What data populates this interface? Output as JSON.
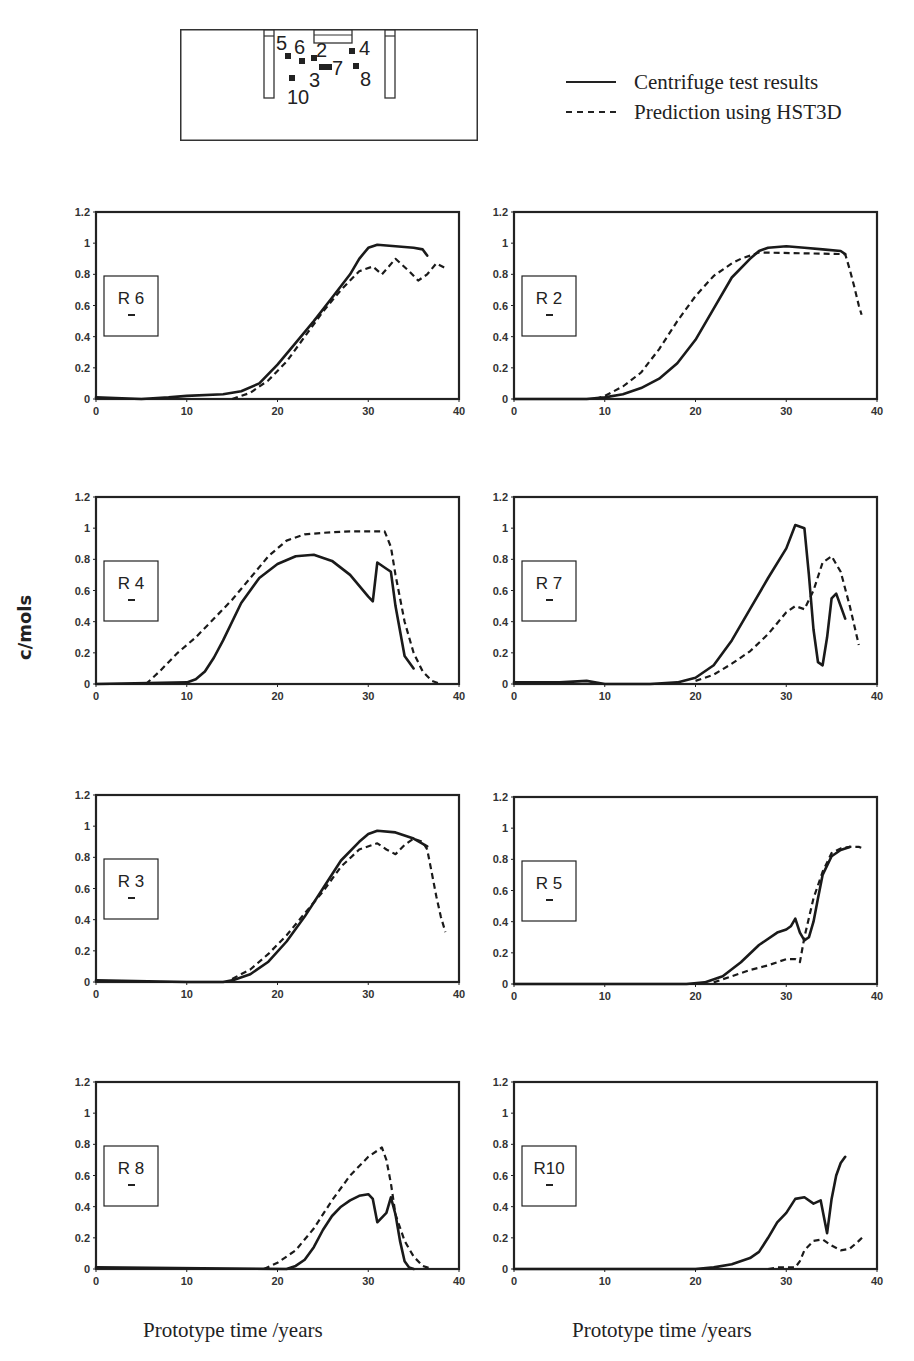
{
  "diagram": {
    "labels": [
      "5",
      "6",
      "2",
      "4",
      "7",
      "8",
      "3",
      "10"
    ]
  },
  "legend": {
    "items": [
      {
        "label": "Centrifuge test results",
        "style": "solid"
      },
      {
        "label": "Prediction using HST3D",
        "style": "dashed"
      }
    ]
  },
  "axes": {
    "ylabel": "c/mols",
    "xlabel_left": "Prototype time /years",
    "xlabel_right": "Prototype time /years"
  },
  "chart_data": [
    {
      "id": "R6",
      "type": "line",
      "title": "R 6",
      "xlim": [
        0,
        40
      ],
      "ylim": [
        0,
        1.2
      ],
      "xticks": [
        0,
        10,
        20,
        30,
        40
      ],
      "yticks": [
        0,
        0.2,
        0.4,
        0.6,
        0.8,
        1,
        1.2
      ],
      "series": [
        {
          "name": "Centrifuge test results",
          "style": "solid",
          "x": [
            0,
            5,
            8,
            10,
            14,
            16,
            18,
            20,
            22,
            24,
            26,
            28,
            29,
            30,
            31,
            33,
            35,
            36,
            36.5
          ],
          "y": [
            0.01,
            0.0,
            0.01,
            0.02,
            0.03,
            0.05,
            0.1,
            0.22,
            0.36,
            0.5,
            0.65,
            0.8,
            0.9,
            0.97,
            0.99,
            0.98,
            0.97,
            0.96,
            0.92
          ]
        },
        {
          "name": "Prediction using HST3D",
          "style": "dashed",
          "x": [
            15,
            17,
            19,
            21,
            23,
            25,
            27,
            29,
            30.5,
            31.5,
            33,
            34.5,
            35.5,
            36.5,
            37.5,
            38.5
          ],
          "y": [
            0.0,
            0.04,
            0.12,
            0.24,
            0.4,
            0.56,
            0.7,
            0.82,
            0.85,
            0.8,
            0.9,
            0.82,
            0.76,
            0.8,
            0.87,
            0.84
          ]
        }
      ]
    },
    {
      "id": "R2",
      "type": "line",
      "title": "R 2",
      "xlim": [
        0,
        40
      ],
      "ylim": [
        0,
        1.2
      ],
      "xticks": [
        0,
        10,
        20,
        30,
        40
      ],
      "yticks": [
        0,
        0.2,
        0.4,
        0.6,
        0.8,
        1,
        1.2
      ],
      "series": [
        {
          "name": "Centrifuge test results",
          "style": "solid",
          "x": [
            0,
            8,
            10,
            12,
            14,
            16,
            18,
            20,
            22,
            24,
            26,
            27,
            28,
            30,
            32,
            34,
            36,
            36.5
          ],
          "y": [
            0.0,
            0.0,
            0.01,
            0.03,
            0.07,
            0.13,
            0.23,
            0.38,
            0.58,
            0.78,
            0.9,
            0.95,
            0.97,
            0.98,
            0.97,
            0.96,
            0.95,
            0.93
          ]
        },
        {
          "name": "Prediction using HST3D",
          "style": "dashed",
          "x": [
            9,
            10,
            12,
            14,
            16,
            18,
            20,
            22,
            24,
            25,
            26,
            27,
            36.5,
            37,
            37.5,
            38,
            38.3
          ],
          "y": [
            0.0,
            0.02,
            0.08,
            0.17,
            0.32,
            0.5,
            0.66,
            0.79,
            0.87,
            0.9,
            0.92,
            0.94,
            0.93,
            0.83,
            0.72,
            0.6,
            0.54
          ]
        }
      ]
    },
    {
      "id": "R4",
      "type": "line",
      "title": "R 4",
      "xlim": [
        0,
        40
      ],
      "ylim": [
        0,
        1.2
      ],
      "xticks": [
        0,
        10,
        20,
        30,
        40
      ],
      "yticks": [
        0,
        0.2,
        0.4,
        0.6,
        0.8,
        1,
        1.2
      ],
      "series": [
        {
          "name": "Centrifuge test results",
          "style": "solid",
          "x": [
            0,
            10,
            11,
            12,
            13,
            14,
            16,
            18,
            20,
            22,
            24,
            26,
            28,
            30,
            30.5,
            31,
            32,
            32.5,
            33,
            34,
            35
          ],
          "y": [
            0.0,
            0.01,
            0.03,
            0.08,
            0.17,
            0.28,
            0.52,
            0.68,
            0.77,
            0.82,
            0.83,
            0.79,
            0.7,
            0.56,
            0.53,
            0.78,
            0.74,
            0.72,
            0.5,
            0.18,
            0.1
          ]
        },
        {
          "name": "Prediction using HST3D",
          "style": "dashed",
          "x": [
            5.5,
            7,
            9,
            11,
            13,
            15,
            17,
            19,
            21,
            23,
            25,
            28,
            30,
            31.8,
            32.5,
            33,
            34,
            35,
            36,
            37,
            38
          ],
          "y": [
            0.0,
            0.08,
            0.2,
            0.3,
            0.42,
            0.54,
            0.68,
            0.82,
            0.92,
            0.96,
            0.97,
            0.98,
            0.98,
            0.98,
            0.88,
            0.7,
            0.4,
            0.2,
            0.08,
            0.02,
            0.0
          ]
        }
      ]
    },
    {
      "id": "R7",
      "type": "line",
      "title": "R 7",
      "xlim": [
        0,
        40
      ],
      "ylim": [
        0,
        1.2
      ],
      "xticks": [
        0,
        10,
        20,
        30,
        40
      ],
      "yticks": [
        0,
        0.2,
        0.4,
        0.6,
        0.8,
        1,
        1.2
      ],
      "series": [
        {
          "name": "Centrifuge test results",
          "style": "solid",
          "x": [
            0,
            5,
            8,
            10,
            15,
            18,
            20,
            22,
            24,
            26,
            28,
            30,
            31,
            32,
            32.5,
            33,
            33.5,
            34,
            34.5,
            35,
            35.5,
            36,
            36.5
          ],
          "y": [
            0.01,
            0.01,
            0.02,
            0.0,
            0.0,
            0.01,
            0.04,
            0.12,
            0.28,
            0.48,
            0.68,
            0.87,
            1.02,
            1.0,
            0.7,
            0.35,
            0.14,
            0.12,
            0.3,
            0.55,
            0.58,
            0.5,
            0.42
          ]
        },
        {
          "name": "Prediction using HST3D",
          "style": "dashed",
          "x": [
            20,
            22,
            24,
            26,
            28,
            30,
            31,
            32,
            33,
            34,
            35,
            36,
            37,
            38
          ],
          "y": [
            0.02,
            0.06,
            0.13,
            0.21,
            0.32,
            0.46,
            0.5,
            0.48,
            0.6,
            0.78,
            0.82,
            0.72,
            0.5,
            0.25
          ]
        }
      ]
    },
    {
      "id": "R3",
      "type": "line",
      "title": "R 3",
      "xlim": [
        0,
        40
      ],
      "ylim": [
        0,
        1.2
      ],
      "xticks": [
        0,
        10,
        20,
        30,
        40
      ],
      "yticks": [
        0,
        0.2,
        0.4,
        0.6,
        0.8,
        1,
        1.2
      ],
      "series": [
        {
          "name": "Centrifuge test results",
          "style": "solid",
          "x": [
            0,
            10,
            14,
            15,
            17,
            19,
            21,
            23,
            25,
            27,
            29,
            30,
            31,
            33,
            35,
            36.5
          ],
          "y": [
            0.01,
            0.0,
            0.0,
            0.01,
            0.05,
            0.13,
            0.26,
            0.42,
            0.6,
            0.78,
            0.9,
            0.95,
            0.97,
            0.96,
            0.92,
            0.87
          ]
        },
        {
          "name": "Prediction using HST3D",
          "style": "dashed",
          "x": [
            15,
            17,
            19,
            21,
            23,
            25,
            27,
            29,
            31,
            32,
            33,
            34,
            35,
            36,
            36.5,
            37,
            37.5,
            38,
            38.5
          ],
          "y": [
            0.02,
            0.08,
            0.18,
            0.3,
            0.44,
            0.58,
            0.74,
            0.85,
            0.89,
            0.85,
            0.82,
            0.88,
            0.92,
            0.9,
            0.85,
            0.7,
            0.55,
            0.42,
            0.32
          ]
        }
      ]
    },
    {
      "id": "R5",
      "type": "line",
      "title": "R 5",
      "xlim": [
        0,
        40
      ],
      "ylim": [
        0,
        1.2
      ],
      "xticks": [
        0,
        10,
        20,
        30,
        40
      ],
      "yticks": [
        0,
        0.2,
        0.4,
        0.6,
        0.8,
        1,
        1.2
      ],
      "series": [
        {
          "name": "Centrifuge test results",
          "style": "solid",
          "x": [
            0,
            19,
            21,
            23,
            25,
            27,
            29,
            30,
            30.5,
            31,
            31.5,
            32,
            32.5,
            33,
            33.5,
            34,
            35,
            36,
            37
          ],
          "y": [
            0.0,
            0.0,
            0.01,
            0.05,
            0.14,
            0.25,
            0.33,
            0.35,
            0.37,
            0.42,
            0.33,
            0.28,
            0.3,
            0.4,
            0.55,
            0.7,
            0.82,
            0.86,
            0.88
          ]
        },
        {
          "name": "Prediction using HST3D",
          "style": "dashed",
          "x": [
            22,
            24,
            26,
            28,
            30,
            31,
            31.5,
            32,
            33,
            34,
            35,
            36,
            37,
            38,
            38.5
          ],
          "y": [
            0.01,
            0.05,
            0.09,
            0.12,
            0.16,
            0.16,
            0.14,
            0.3,
            0.55,
            0.72,
            0.84,
            0.87,
            0.88,
            0.88,
            0.87
          ]
        }
      ]
    },
    {
      "id": "R8",
      "type": "line",
      "title": "R 8",
      "xlim": [
        0,
        40
      ],
      "ylim": [
        0,
        1.2
      ],
      "xticks": [
        0,
        10,
        20,
        30,
        40
      ],
      "yticks": [
        0,
        0.2,
        0.4,
        0.6,
        0.8,
        1,
        1.2
      ],
      "series": [
        {
          "name": "Centrifuge test results",
          "style": "solid",
          "x": [
            0,
            21,
            22,
            23,
            24,
            25,
            26,
            27,
            28,
            29,
            30,
            30.5,
            31,
            32,
            32.5,
            33,
            33.5,
            34,
            34.5,
            35
          ],
          "y": [
            0.01,
            0.0,
            0.02,
            0.06,
            0.14,
            0.25,
            0.34,
            0.4,
            0.44,
            0.47,
            0.48,
            0.45,
            0.3,
            0.36,
            0.46,
            0.35,
            0.18,
            0.05,
            0.01,
            0.0
          ]
        },
        {
          "name": "Prediction using HST3D",
          "style": "dashed",
          "x": [
            18.5,
            20,
            22,
            24,
            26,
            28,
            30,
            31.5,
            32,
            32.5,
            33,
            34,
            35,
            36,
            37
          ],
          "y": [
            0.0,
            0.04,
            0.12,
            0.26,
            0.44,
            0.6,
            0.72,
            0.78,
            0.7,
            0.55,
            0.35,
            0.18,
            0.08,
            0.02,
            0.0
          ]
        }
      ]
    },
    {
      "id": "R10",
      "type": "line",
      "title": "R10",
      "xlim": [
        0,
        40
      ],
      "ylim": [
        0,
        1.2
      ],
      "xticks": [
        0,
        10,
        20,
        30,
        40
      ],
      "yticks": [
        0,
        0.2,
        0.4,
        0.6,
        0.8,
        1,
        1.2
      ],
      "series": [
        {
          "name": "Centrifuge test results",
          "style": "solid",
          "x": [
            0,
            20,
            22,
            24,
            26,
            27,
            28,
            29,
            30,
            31,
            32,
            33,
            33.8,
            34.5,
            35,
            35.5,
            36,
            36.5
          ],
          "y": [
            0.0,
            0.0,
            0.01,
            0.03,
            0.07,
            0.11,
            0.2,
            0.3,
            0.36,
            0.45,
            0.46,
            0.42,
            0.44,
            0.23,
            0.45,
            0.6,
            0.68,
            0.72
          ]
        },
        {
          "name": "Prediction using HST3D",
          "style": "dashed",
          "x": [
            28,
            29,
            30,
            31,
            31.5,
            32,
            33,
            34,
            35,
            36,
            37,
            38,
            38.5
          ],
          "y": [
            0.0,
            0.01,
            0.01,
            0.01,
            0.05,
            0.12,
            0.18,
            0.19,
            0.15,
            0.12,
            0.13,
            0.18,
            0.21
          ]
        }
      ]
    }
  ]
}
